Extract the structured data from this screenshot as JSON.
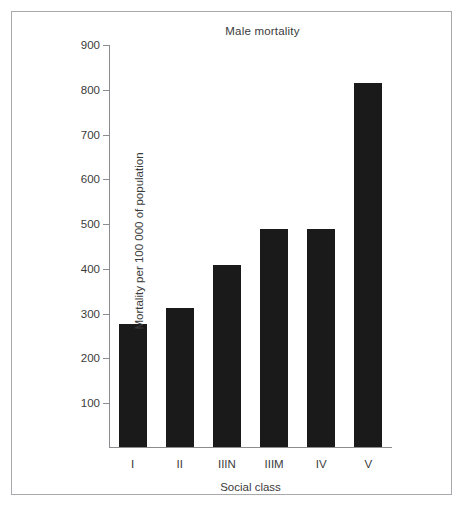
{
  "chart_data": {
    "type": "bar",
    "title": "Male mortality",
    "xlabel": "Social class",
    "ylabel": "Mortality per 100 000 of population",
    "categories": [
      "I",
      "II",
      "IIIN",
      "IIIM",
      "IV",
      "V"
    ],
    "values": [
      274,
      311,
      406,
      488,
      488,
      813
    ],
    "ylim": [
      0,
      900
    ],
    "yticks": [
      100,
      200,
      300,
      400,
      500,
      600,
      700,
      800,
      900
    ],
    "ytick_labels": [
      "100",
      "200",
      "300",
      "400",
      "500",
      "600",
      "700",
      "800",
      "900"
    ],
    "grid": false,
    "legend": null,
    "bar_color": "#1a1a1a",
    "axis_color": "#8c8c90",
    "text_color": "#3b3b3b",
    "frame_color": "#a9a9ad",
    "background": "#ffffff"
  }
}
